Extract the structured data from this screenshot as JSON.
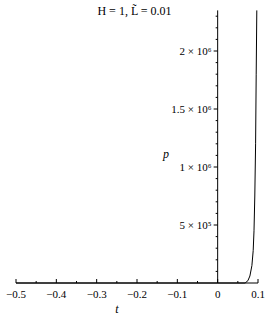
{
  "chart_data": {
    "type": "line",
    "title": "H = 1, L̃ = 0.01",
    "xlabel": "t",
    "ylabel": "p",
    "xlim": [
      -0.5,
      0.1
    ],
    "ylim": [
      0,
      2350000
    ],
    "x_ticks": [
      -0.5,
      -0.4,
      -0.3,
      -0.2,
      -0.1,
      0,
      0.1
    ],
    "x_tick_labels": [
      "−0.5",
      "−0.4",
      "−0.3",
      "−0.2",
      "−0.1",
      "0",
      "0.1"
    ],
    "y_ticks": [
      500000,
      1000000,
      1500000,
      2000000
    ],
    "y_tick_labels": [
      "5 × 10⁵",
      "1 × 10⁶",
      "1.5 × 10⁶",
      "2 × 10⁶"
    ],
    "grid": false,
    "legend": null,
    "series": [
      {
        "name": "p(t)",
        "color": "#000000",
        "x": [
          -0.5,
          0.0,
          0.05,
          0.068,
          0.075,
          0.08,
          0.085,
          0.088,
          0.09,
          0.092,
          0.094,
          0.0955,
          0.097
        ],
        "y": [
          0,
          0,
          0,
          0,
          20000,
          60000,
          150000,
          280000,
          450000,
          750000,
          1200000,
          1800000,
          2350000
        ]
      }
    ]
  }
}
